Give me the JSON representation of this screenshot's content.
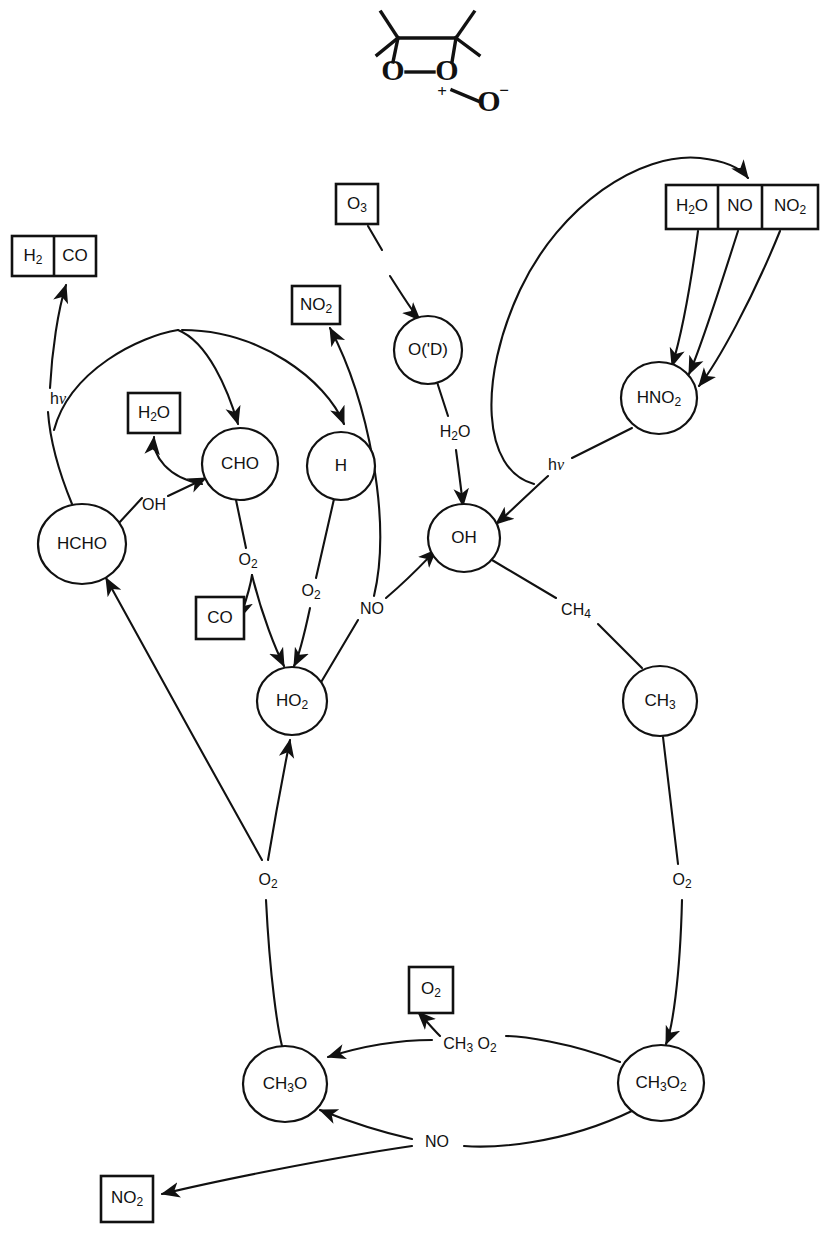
{
  "figure": {
    "background_color": "#ffffff",
    "line_color": "#111111"
  },
  "structure": {
    "name": "dimethyldioxirane-oxide skeletal structure",
    "atoms": [
      {
        "id": "struct-o-left",
        "label": "O"
      },
      {
        "id": "struct-o-center",
        "label": "O"
      },
      {
        "id": "struct-o-right",
        "label": "O"
      }
    ],
    "charges": [
      {
        "id": "struct-plus",
        "label": "+"
      },
      {
        "id": "struct-minus",
        "label": "−"
      }
    ],
    "bond_dash": "—"
  },
  "nodes": [
    {
      "id": "hcho",
      "label": "HCHO",
      "shape": "circle",
      "cx": 82,
      "cy": 544,
      "rx": 44,
      "ry": 40
    },
    {
      "id": "cho",
      "label": "CHO",
      "shape": "circle",
      "cx": 240,
      "cy": 464,
      "rx": 38,
      "ry": 36
    },
    {
      "id": "h",
      "label": "H",
      "shape": "circle",
      "cx": 341,
      "cy": 466,
      "rx": 34,
      "ry": 34
    },
    {
      "id": "ho2",
      "label": "HO2",
      "shape": "circle",
      "cx": 292,
      "cy": 701,
      "rx": 35,
      "ry": 34
    },
    {
      "id": "o1d",
      "label": "O('D)",
      "shape": "circle",
      "cx": 428,
      "cy": 350,
      "rx": 34,
      "ry": 34
    },
    {
      "id": "oh",
      "label": "OH",
      "shape": "circle",
      "cx": 464,
      "cy": 538,
      "rx": 36,
      "ry": 34
    },
    {
      "id": "hno2",
      "label": "HNO2",
      "shape": "circle",
      "cx": 659,
      "cy": 398,
      "rx": 38,
      "ry": 36
    },
    {
      "id": "ch3",
      "label": "CH3",
      "shape": "circle",
      "cx": 660,
      "cy": 701,
      "rx": 37,
      "ry": 35
    },
    {
      "id": "ch3o",
      "label": "CH3O",
      "shape": "circle",
      "cx": 285,
      "cy": 1084,
      "rx": 42,
      "ry": 38
    },
    {
      "id": "ch3o2",
      "label": "CH3O2",
      "shape": "circle",
      "cx": 661,
      "cy": 1083,
      "rx": 43,
      "ry": 38
    }
  ],
  "boxes": [
    {
      "id": "box-h2-co",
      "cells": [
        "H2",
        "CO"
      ],
      "x": 12,
      "y": 236,
      "w": 84,
      "h": 40
    },
    {
      "id": "box-h2o-left",
      "cells": [
        "H2O"
      ],
      "x": 128,
      "y": 393,
      "w": 52,
      "h": 40
    },
    {
      "id": "box-co",
      "cells": [
        "CO"
      ],
      "x": 196,
      "y": 597,
      "w": 48,
      "h": 42
    },
    {
      "id": "box-no2-mid",
      "cells": [
        "NO2"
      ],
      "x": 292,
      "y": 286,
      "w": 48,
      "h": 38
    },
    {
      "id": "box-o3",
      "cells": [
        "O3"
      ],
      "x": 336,
      "y": 184,
      "w": 42,
      "h": 40
    },
    {
      "id": "box-h2o-no-no2",
      "cells": [
        "H2O",
        "NO",
        "NO2"
      ],
      "x": 666,
      "y": 185,
      "w": 152,
      "h": 44
    },
    {
      "id": "box-o2-mid",
      "cells": [
        "O2"
      ],
      "x": 409,
      "y": 967,
      "w": 44,
      "h": 46
    },
    {
      "id": "box-no2-bottom",
      "cells": [
        "NO2"
      ],
      "x": 101,
      "y": 1176,
      "w": 52,
      "h": 46
    }
  ],
  "edge_labels": [
    {
      "id": "label-hv-left",
      "text": "hv",
      "x": 58,
      "y": 400
    },
    {
      "id": "label-oh-hcho",
      "text": "OH",
      "x": 154,
      "y": 506
    },
    {
      "id": "label-o2-cho",
      "text": "O2",
      "x": 248,
      "y": 561
    },
    {
      "id": "label-o2-h",
      "text": "O2",
      "x": 311,
      "y": 592
    },
    {
      "id": "label-no-mid",
      "text": "NO",
      "x": 372,
      "y": 610
    },
    {
      "id": "label-h2o-o1d",
      "text": "H2O",
      "x": 455,
      "y": 433
    },
    {
      "id": "label-hv-hno2",
      "text": "hv",
      "x": 556,
      "y": 466
    },
    {
      "id": "label-ch4",
      "text": "CH4",
      "x": 576,
      "y": 611
    },
    {
      "id": "label-o2-left",
      "text": "O2",
      "x": 268,
      "y": 881
    },
    {
      "id": "label-o2-right",
      "text": "O2",
      "x": 682,
      "y": 881
    },
    {
      "id": "label-ch3o2-mid",
      "text": "CH3 O2",
      "x": 470,
      "y": 1045
    },
    {
      "id": "label-no-bottom",
      "text": "NO",
      "x": 437,
      "y": 1143
    }
  ],
  "species_legend": {
    "radicals": [
      "HCHO",
      "CHO",
      "H",
      "HO2",
      "O('D)",
      "OH",
      "HNO2",
      "CH3",
      "CH3O",
      "CH3O2"
    ],
    "reservoirs": [
      "H2",
      "CO",
      "H2O",
      "NO2",
      "O3",
      "NO",
      "O2"
    ],
    "photolysis_symbol": "hv"
  }
}
